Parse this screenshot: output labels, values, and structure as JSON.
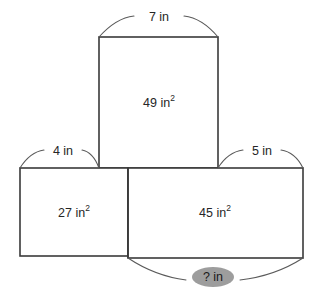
{
  "diagram": {
    "unit": "in",
    "area_unit": "in²",
    "stroke_color": "#3a3a3a",
    "arc_color": "#5a5a5a",
    "highlight_color": "#9d9d9d",
    "background_color": "#ffffff"
  },
  "rectangles": [
    {
      "id": "top",
      "area_value": "49",
      "area_unit": "in",
      "area_label": "49 in²",
      "width_label": "7 in",
      "x": 99,
      "y": 37,
      "w": 119,
      "h": 131
    },
    {
      "id": "bottom-left",
      "area_value": "27",
      "area_unit": "in",
      "area_label": "27 in²",
      "width_label": "4 in",
      "x": 20,
      "y": 168,
      "w": 108,
      "h": 88
    },
    {
      "id": "bottom-right",
      "area_value": "45",
      "area_unit": "in",
      "area_label": "45 in²",
      "width_label": "5 in",
      "x": 128,
      "y": 168,
      "w": 175,
      "h": 90
    }
  ],
  "dimension_labels": {
    "top_width": "7 in",
    "left_width": "4 in",
    "right_width": "5 in",
    "unknown_bottom": "? in"
  },
  "area_labels": {
    "top": "49",
    "bottom_left": "27",
    "bottom_right": "45",
    "superscript": "2",
    "unit": "in"
  }
}
